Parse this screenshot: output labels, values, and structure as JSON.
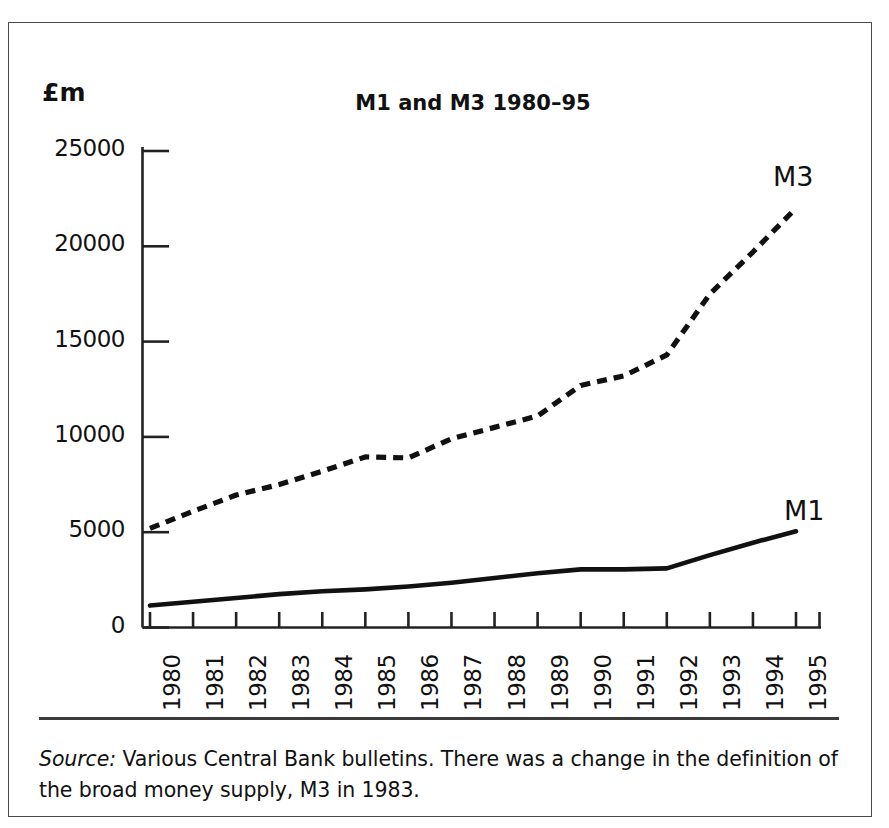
{
  "figure": {
    "unit_label": "£m",
    "title": "M1 and M3 1980–95",
    "source_prefix": "Source:",
    "source_text": " Various Central Bank bulletins. There was a change in the definition of the broad money supply, M3 in 1983.",
    "frame_color": "#4a4a4a",
    "ink_color": "#111111"
  },
  "labels": {
    "m1": "M1",
    "m3": "M3"
  },
  "chart_data": {
    "type": "line",
    "title": "M1 and M3 1980–95",
    "xlabel": "",
    "ylabel": "£m",
    "grid": false,
    "legend_position": "inline-end-of-line",
    "xlim": [
      1980,
      1995
    ],
    "ylim": [
      0,
      25000
    ],
    "ytick_labels": [
      "0",
      "5000",
      "10000",
      "15000",
      "20000",
      "25000"
    ],
    "yticks": [
      0,
      5000,
      10000,
      15000,
      20000,
      25000
    ],
    "categories": [
      "1980",
      "1981",
      "1982",
      "1983",
      "1984",
      "1985",
      "1986",
      "1987",
      "1988",
      "1989",
      "1990",
      "1991",
      "1992",
      "1993",
      "1994",
      "1995"
    ],
    "x": [
      1980,
      1981,
      1982,
      1983,
      1984,
      1985,
      1986,
      1987,
      1988,
      1989,
      1990,
      1991,
      1992,
      1993,
      1994,
      1995
    ],
    "series": [
      {
        "name": "M1",
        "style": "solid",
        "color": "#111111",
        "values": [
          1150,
          1350,
          1550,
          1750,
          1900,
          2000,
          2150,
          2350,
          2600,
          2850,
          3050,
          3050,
          3100,
          3800,
          4450,
          5050
        ]
      },
      {
        "name": "M3",
        "style": "dashed",
        "color": "#111111",
        "values": [
          5200,
          6100,
          6950,
          7500,
          8200,
          8950,
          8900,
          9900,
          10500,
          11100,
          12700,
          13200,
          14300,
          17500,
          19700,
          22000
        ]
      }
    ],
    "annotations": [
      {
        "text": "M3",
        "near_series": "M3",
        "at_x": 1995
      },
      {
        "text": "M1",
        "near_series": "M1",
        "at_x": 1995
      }
    ]
  }
}
